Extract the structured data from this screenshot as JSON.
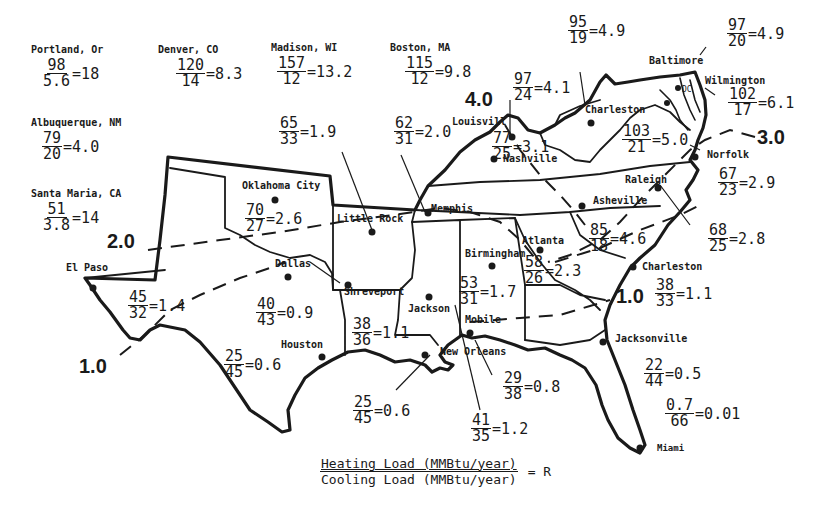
{
  "figure": {
    "type": "map",
    "legend": {
      "numerator": "Heating Load (MMBtu/year)",
      "denominator": "Cooling Load (MMBtu/year)",
      "equals": "= R"
    },
    "contours": [
      {
        "label": "4.0"
      },
      {
        "label": "3.0"
      },
      {
        "label": "2.0"
      },
      {
        "label": "1.0"
      },
      {
        "label": "1.0"
      }
    ],
    "outside_cities": [
      {
        "name": "Portland, Or",
        "heating": "98",
        "cooling": "5.6",
        "ratio": "=18"
      },
      {
        "name": "Denver, CO",
        "heating": "120",
        "cooling": "14",
        "ratio": "=8.3"
      },
      {
        "name": "Madison, WI",
        "heating": "157",
        "cooling": "12",
        "ratio": "=13.2"
      },
      {
        "name": "Boston, MA",
        "heating": "115",
        "cooling": "12",
        "ratio": "=9.8"
      },
      {
        "name": "Albuquerque, NM",
        "heating": "79",
        "cooling": "20",
        "ratio": "=4.0"
      },
      {
        "name": "Santa Maria, CA",
        "heating": "51",
        "cooling": "3.8",
        "ratio": "=14"
      }
    ],
    "map_cities": [
      {
        "name": "Oklahoma City"
      },
      {
        "name": "Little Rock"
      },
      {
        "name": "Memphis"
      },
      {
        "name": "Louisvill"
      },
      {
        "name": "Nashville"
      },
      {
        "name": "Charleston"
      },
      {
        "name": "DC"
      },
      {
        "name": "Baltimore"
      },
      {
        "name": "Wilmington"
      },
      {
        "name": "Norfolk"
      },
      {
        "name": "Raleigh"
      },
      {
        "name": "Asheville"
      },
      {
        "name": "Atlanta"
      },
      {
        "name": "Birmingham"
      },
      {
        "name": "Charleston"
      },
      {
        "name": "El Paso"
      },
      {
        "name": "Dallas"
      },
      {
        "name": "Shreveport"
      },
      {
        "name": "Jackson"
      },
      {
        "name": "Mobile"
      },
      {
        "name": "New Orleans"
      },
      {
        "name": "Houston"
      },
      {
        "name": "Jacksonville"
      },
      {
        "name": "Miami"
      }
    ],
    "ratios": [
      {
        "id": "west-virginia-charleston",
        "heating": "95",
        "cooling": "19",
        "ratio": "=4.9"
      },
      {
        "id": "baltimore",
        "heating": "97",
        "cooling": "20",
        "ratio": "=4.9"
      },
      {
        "id": "wilmington",
        "heating": "102",
        "cooling": "17",
        "ratio": "=6.1"
      },
      {
        "id": "dc",
        "heating": "103",
        "cooling": "21",
        "ratio": "=5.0"
      },
      {
        "id": "louisville",
        "heating": "97",
        "cooling": "24",
        "ratio": "=4.1"
      },
      {
        "id": "nashville",
        "heating": "77",
        "cooling": "25",
        "ratio": "=3.1"
      },
      {
        "id": "little-rock",
        "heating": "65",
        "cooling": "33",
        "ratio": "=1.9"
      },
      {
        "id": "memphis",
        "heating": "62",
        "cooling": "31",
        "ratio": "=2.0"
      },
      {
        "id": "oklahoma-city",
        "heating": "70",
        "cooling": "27",
        "ratio": "=2.6"
      },
      {
        "id": "norfolk",
        "heating": "67",
        "cooling": "23",
        "ratio": "=2.9"
      },
      {
        "id": "raleigh",
        "heating": "68",
        "cooling": "25",
        "ratio": "=2.8"
      },
      {
        "id": "asheville",
        "heating": "85",
        "cooling": "18",
        "ratio": "=4.6"
      },
      {
        "id": "atlanta",
        "heating": "58",
        "cooling": "26",
        "ratio": "=2.3"
      },
      {
        "id": "birmingham",
        "heating": "53",
        "cooling": "31",
        "ratio": "=1.7"
      },
      {
        "id": "charleston-sc",
        "heating": "38",
        "cooling": "33",
        "ratio": "=1.1"
      },
      {
        "id": "el-paso",
        "heating": "45",
        "cooling": "32",
        "ratio": "=1.4"
      },
      {
        "id": "dallas",
        "heating": "40",
        "cooling": "43",
        "ratio": "=0.9"
      },
      {
        "id": "shreveport",
        "heating": "38",
        "cooling": "36",
        "ratio": "=1.1"
      },
      {
        "id": "houston",
        "heating": "25",
        "cooling": "45",
        "ratio": "=0.6"
      },
      {
        "id": "new-orleans",
        "heating": "25",
        "cooling": "45",
        "ratio": "=0.6"
      },
      {
        "id": "jackson",
        "heating": "41",
        "cooling": "35",
        "ratio": "=1.2"
      },
      {
        "id": "mobile",
        "heating": "29",
        "cooling": "38",
        "ratio": "=0.8"
      },
      {
        "id": "jacksonville",
        "heating": "22",
        "cooling": "44",
        "ratio": "=0.5"
      },
      {
        "id": "miami",
        "heating": "0.7",
        "cooling": "66",
        "ratio": "=0.01"
      }
    ]
  }
}
